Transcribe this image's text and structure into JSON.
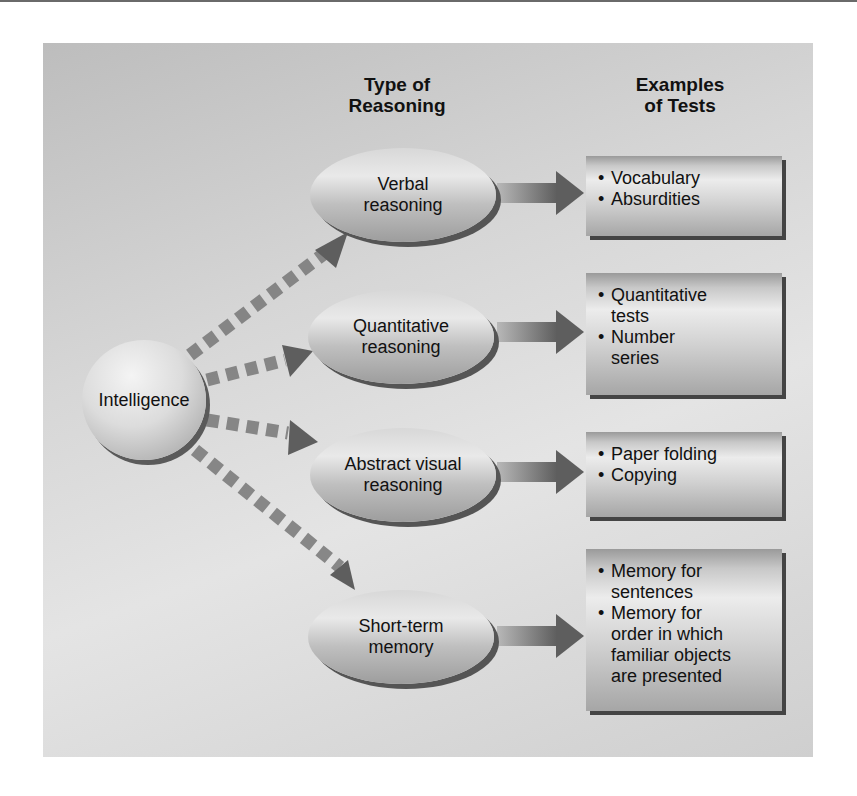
{
  "headers": {
    "type_of_reasoning": [
      "Type of",
      "Reasoning"
    ],
    "examples_of_tests": [
      "Examples",
      "of Tests"
    ]
  },
  "root": {
    "label": "Intelligence"
  },
  "branches": [
    {
      "reasoning": [
        "Verbal",
        "reasoning"
      ],
      "tests": [
        [
          "Vocabulary"
        ],
        [
          "Absurdities"
        ]
      ]
    },
    {
      "reasoning": [
        "Quantitative",
        "reasoning"
      ],
      "tests": [
        [
          "Quantitative",
          "tests"
        ],
        [
          "Number",
          "series"
        ]
      ]
    },
    {
      "reasoning": [
        "Abstract visual",
        "reasoning"
      ],
      "tests": [
        [
          "Paper folding"
        ],
        [
          "Copying"
        ]
      ]
    },
    {
      "reasoning": [
        "Short-term",
        "memory"
      ],
      "tests": [
        [
          "Memory for",
          "sentences"
        ],
        [
          "Memory for",
          "order in which",
          "familiar objects",
          "are presented"
        ]
      ]
    }
  ],
  "bullet_glyph": "•",
  "colors": {
    "panel": "#d4d4d4",
    "arrow": "#6e6e6e",
    "text": "#111111"
  }
}
